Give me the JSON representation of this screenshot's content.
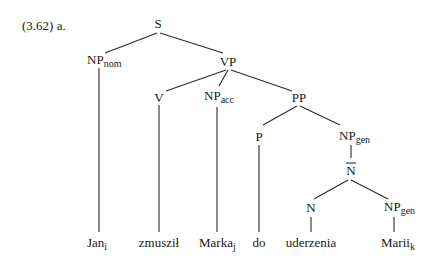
{
  "example_label": "(3.62) a.",
  "nodes": {
    "S": {
      "label": "S",
      "sub": ""
    },
    "NPnom": {
      "label": "NP",
      "sub": "nom"
    },
    "VP": {
      "label": "VP",
      "sub": ""
    },
    "V": {
      "label": "V",
      "sub": ""
    },
    "NPacc": {
      "label": "NP",
      "sub": "acc"
    },
    "PP": {
      "label": "PP",
      "sub": ""
    },
    "P": {
      "label": "P",
      "sub": ""
    },
    "NPgen1": {
      "label": "NP",
      "sub": "gen"
    },
    "Nbar": {
      "label": "N",
      "sub": "",
      "overline": true
    },
    "N": {
      "label": "N",
      "sub": ""
    },
    "NPgen2": {
      "label": "NP",
      "sub": "gen"
    }
  },
  "leaves": [
    {
      "word": "Jan",
      "index": "i"
    },
    {
      "word": "zmusził",
      "index": ""
    },
    {
      "word": "Marka",
      "index": "j"
    },
    {
      "word": "do",
      "index": ""
    },
    {
      "word": "uderzenia",
      "index": ""
    },
    {
      "word": "Marii",
      "index": "k"
    }
  ]
}
